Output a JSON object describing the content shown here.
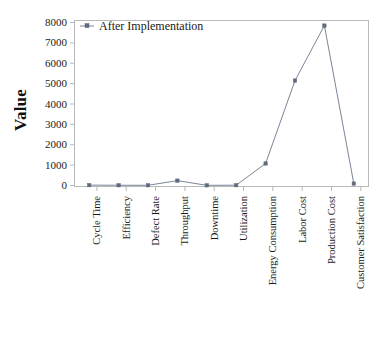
{
  "chart_data": {
    "type": "line",
    "title": "",
    "xlabel": "",
    "ylabel": "Value",
    "categories": [
      "Cycle Time",
      "Efficiency",
      "Defect Rate",
      "Throughput",
      "Downtime",
      "Utilization",
      "Energy Consumption",
      "Labor Cost",
      "Production Cost",
      "Customer Satisfaction"
    ],
    "series": [
      {
        "name": "After Implementation",
        "values": [
          18,
          12,
          10,
          240,
          8,
          15,
          1080,
          5150,
          7850,
          95
        ]
      }
    ],
    "yticks": [
      0,
      1000,
      2000,
      3000,
      4000,
      5000,
      6000,
      7000,
      8000
    ],
    "ytick_labels": [
      "0",
      "1000",
      "2000",
      "3000",
      "4000",
      "5000",
      "6000",
      "7000",
      "8000"
    ],
    "ylim": [
      0,
      8000
    ],
    "grid": false,
    "legend_position": "top-left",
    "marker": "square-dot",
    "line_color": "#7a8596",
    "marker_color": "#5f6a7d",
    "axis_color": "#b9b9b9"
  },
  "legend": {
    "entries": [
      {
        "label": "After Implementation"
      }
    ]
  },
  "axes": {
    "y_title": "Value"
  }
}
